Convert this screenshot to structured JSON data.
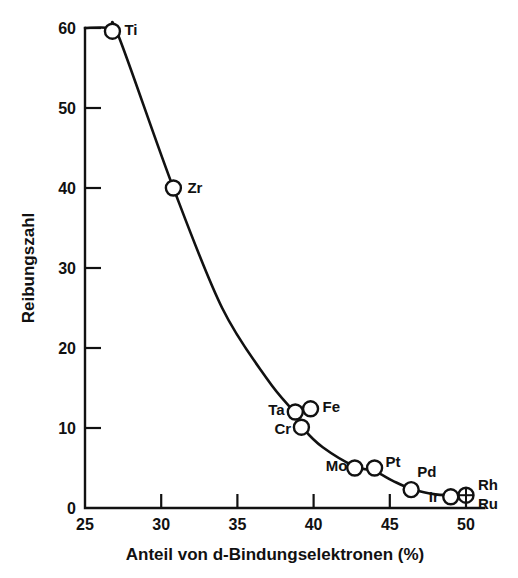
{
  "chart_data": {
    "type": "scatter",
    "title": "",
    "xlabel": "Anteil von d-Bindungselektronen (%)",
    "ylabel": "Reibungszahl",
    "xlim": [
      25,
      51
    ],
    "ylim": [
      0,
      60
    ],
    "xticks": [
      25,
      30,
      35,
      40,
      45,
      50
    ],
    "yticks": [
      0,
      10,
      20,
      30,
      40,
      50,
      60
    ],
    "grid": false,
    "legend": false,
    "legend_position": "none",
    "point_label_field": "element",
    "points": [
      {
        "element": "Ti",
        "x": 26.8,
        "y": 59.6,
        "marker": "open-circle",
        "label_dx": 12,
        "label_dy": 4
      },
      {
        "element": "Zr",
        "x": 30.8,
        "y": 40.0,
        "marker": "open-circle",
        "label_dx": 14,
        "label_dy": 5
      },
      {
        "element": "Ta",
        "x": 38.8,
        "y": 12.0,
        "marker": "open-circle",
        "label_dx": -27,
        "label_dy": 3
      },
      {
        "element": "Fe",
        "x": 39.8,
        "y": 12.4,
        "marker": "open-circle",
        "label_dx": 12,
        "label_dy": 3
      },
      {
        "element": "Cr",
        "x": 39.2,
        "y": 10.1,
        "marker": "open-circle",
        "label_dx": -27,
        "label_dy": 7
      },
      {
        "element": "Mo",
        "x": 42.7,
        "y": 5.0,
        "marker": "open-circle",
        "label_dx": -29,
        "label_dy": 3
      },
      {
        "element": "Pt",
        "x": 44.0,
        "y": 5.0,
        "marker": "open-circle",
        "label_dx": 11,
        "label_dy": -1
      },
      {
        "element": "Pd",
        "x": 46.4,
        "y": 2.3,
        "marker": "open-circle",
        "label_dx": 6,
        "label_dy": -13
      },
      {
        "element": "Ir",
        "x": 49.0,
        "y": 1.4,
        "marker": "open-circle",
        "label_dx": -22,
        "label_dy": 5
      },
      {
        "element": "Rh",
        "x": 50.0,
        "y": 1.6,
        "marker": "crossed-circle",
        "label_dx": 12,
        "label_dy": -5
      },
      {
        "element": "Ru",
        "x": 50.0,
        "y": 1.3,
        "marker": "none",
        "label_dx": 12,
        "label_dy": 11
      }
    ],
    "curve": [
      {
        "x": 25.0,
        "y": 60.0
      },
      {
        "x": 26.6,
        "y": 60.0
      },
      {
        "x": 27.2,
        "y": 59.0
      },
      {
        "x": 30.8,
        "y": 40.0
      },
      {
        "x": 34.0,
        "y": 25.0
      },
      {
        "x": 37.0,
        "y": 16.0
      },
      {
        "x": 38.8,
        "y": 11.8
      },
      {
        "x": 39.4,
        "y": 9.8
      },
      {
        "x": 40.6,
        "y": 7.6
      },
      {
        "x": 42.7,
        "y": 5.2
      },
      {
        "x": 44.0,
        "y": 4.6
      },
      {
        "x": 45.2,
        "y": 3.4
      },
      {
        "x": 46.4,
        "y": 2.4
      },
      {
        "x": 48.0,
        "y": 1.7
      },
      {
        "x": 50.2,
        "y": 1.5
      }
    ]
  },
  "axis": {
    "x_tick_labels": [
      "25",
      "30",
      "35",
      "40",
      "45",
      "50"
    ],
    "y_tick_labels": [
      "0",
      "10",
      "20",
      "30",
      "40",
      "50",
      "60"
    ],
    "x_title": "Anteil von d-Bindungselektronen (%)",
    "y_title": "Reibungszahl"
  },
  "colors": {
    "ink": "#111111",
    "background": "#ffffff"
  }
}
